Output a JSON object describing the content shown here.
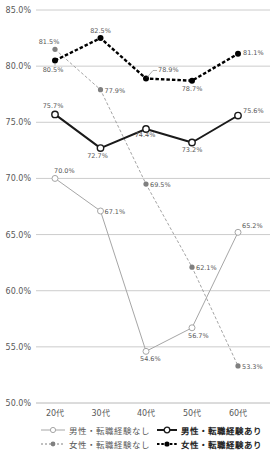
{
  "chart_data": {
    "type": "line",
    "title": "",
    "xlabel": "",
    "ylabel": "",
    "categories": [
      "20代",
      "30代",
      "40代",
      "50代",
      "60代"
    ],
    "ylim": [
      50.0,
      85.0
    ],
    "yticks": [
      "50.0%",
      "55.0%",
      "60.0%",
      "65.0%",
      "70.0%",
      "75.0%",
      "80.0%",
      "85.0%"
    ],
    "grid": true,
    "legend_position": "bottom",
    "series": [
      {
        "name": "男性・転職経験なし",
        "values": [
          70.0,
          67.1,
          54.6,
          56.7,
          65.2
        ],
        "labels": [
          "70.0%",
          "67.1%",
          "54.6%",
          "56.7%",
          "65.2%"
        ],
        "style": "thin-solid-hollow-marker",
        "color": "#a6a6a6"
      },
      {
        "name": "女性・転職経験なし",
        "values": [
          81.5,
          77.9,
          69.5,
          62.1,
          53.3
        ],
        "labels": [
          "81.5%",
          "77.9%",
          "69.5%",
          "62.1%",
          "53.3%"
        ],
        "style": "thin-dashed-filled-marker",
        "color": "#808080"
      },
      {
        "name": "男性・転職経験あり",
        "values": [
          75.7,
          72.7,
          74.4,
          73.2,
          75.6
        ],
        "labels": [
          "75.7%",
          "72.7%",
          "74.4%",
          "73.2%",
          "75.6%"
        ],
        "style": "thick-solid-hollow-marker",
        "color": "#1a1a1a"
      },
      {
        "name": "女性・転職経験あり",
        "values": [
          80.5,
          82.5,
          78.9,
          78.7,
          81.1
        ],
        "labels": [
          "80.5%",
          "82.5%",
          "78.9%",
          "78.7%",
          "81.1%"
        ],
        "style": "thick-dashed-filled-marker",
        "color": "#000000"
      }
    ]
  },
  "legend": {
    "items": [
      {
        "label": "男性・転職経験なし"
      },
      {
        "label": "女性・転職経験なし"
      },
      {
        "label": "男性・転職経験あり"
      },
      {
        "label": "女性・転職経験あり"
      }
    ]
  }
}
